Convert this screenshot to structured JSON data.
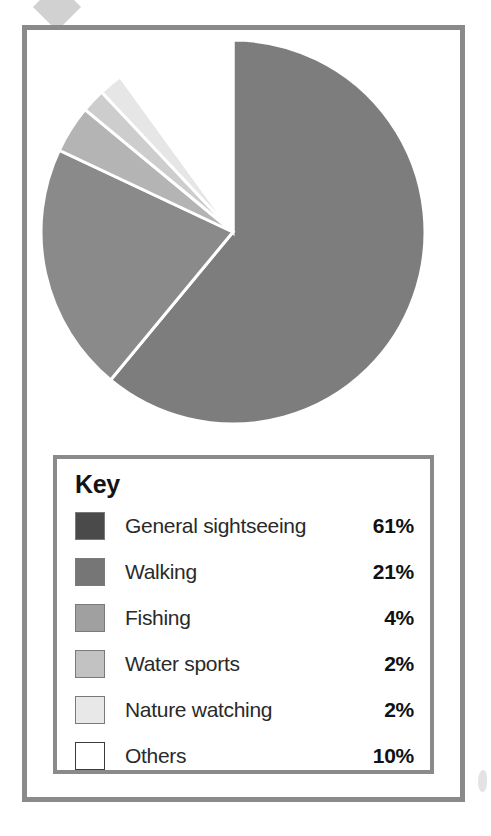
{
  "figure": {
    "legend_title": "Key"
  },
  "chart_data": {
    "type": "pie",
    "title": "",
    "subtitle": "",
    "xlabel": "",
    "ylabel": "",
    "legend_position": "below-chart",
    "legend_title": "Key",
    "start_angle_deg": 0,
    "direction": "clockwise",
    "unit": "%",
    "total": 100,
    "categories": [
      "General sightseeing",
      "Walking",
      "Fishing",
      "Water sports",
      "Nature watching",
      "Others"
    ],
    "values": [
      61,
      21,
      4,
      2,
      2,
      10
    ],
    "value_labels": [
      "61%",
      "21%",
      "4%",
      "2%",
      "2%",
      "10%"
    ],
    "slice_colors": [
      "#7d7d7d",
      "#8a8a8a",
      "#b4b4b4",
      "#cdcdcd",
      "#e6e6e6",
      "#ffffff"
    ],
    "swatch_colors": [
      "#4a4a4a",
      "#767676",
      "#a0a0a0",
      "#c2c2c2",
      "#e8e8e8",
      "#ffffff"
    ],
    "slices": [
      {
        "label": "General sightseeing",
        "value": 61,
        "value_label": "61%",
        "slice_color": "#7d7d7d",
        "swatch_color": "#4a4a4a"
      },
      {
        "label": "Walking",
        "value": 21,
        "value_label": "21%",
        "slice_color": "#8a8a8a",
        "swatch_color": "#767676"
      },
      {
        "label": "Fishing",
        "value": 4,
        "value_label": "4%",
        "slice_color": "#b4b4b4",
        "swatch_color": "#a0a0a0"
      },
      {
        "label": "Water sports",
        "value": 2,
        "value_label": "2%",
        "slice_color": "#cdcdcd",
        "swatch_color": "#c2c2c2"
      },
      {
        "label": "Nature watching",
        "value": 2,
        "value_label": "2%",
        "slice_color": "#e6e6e6",
        "swatch_color": "#e8e8e8"
      },
      {
        "label": "Others",
        "value": 10,
        "value_label": "10%",
        "slice_color": "#ffffff",
        "swatch_color": "#ffffff"
      }
    ]
  }
}
